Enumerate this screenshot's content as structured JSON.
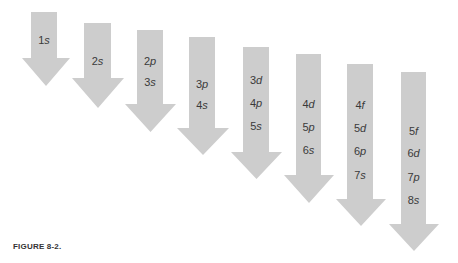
{
  "caption": "FIGURE 8-2.",
  "colors": {
    "arrow": "#cdcdcd",
    "text": "#3a3a3a"
  },
  "arrows": [
    {
      "shaft_left": 31,
      "shaft_right": 57,
      "top": 12,
      "head_start": 58,
      "head_left": 22,
      "head_right": 70,
      "tip": 86,
      "labels": [
        {
          "n": "1",
          "l": "s",
          "y": 40
        }
      ]
    },
    {
      "shaft_left": 84,
      "shaft_right": 111,
      "top": 23,
      "head_start": 78,
      "head_left": 72,
      "head_right": 124,
      "tip": 108,
      "labels": [
        {
          "n": "2",
          "l": "s",
          "y": 61
        }
      ]
    },
    {
      "shaft_left": 137,
      "shaft_right": 163,
      "top": 30,
      "head_start": 104,
      "head_left": 125,
      "head_right": 176,
      "tip": 132,
      "labels": [
        {
          "n": "2",
          "l": "p",
          "y": 61
        },
        {
          "n": "3",
          "l": "s",
          "y": 82
        }
      ]
    },
    {
      "shaft_left": 189,
      "shaft_right": 215,
      "top": 37,
      "head_start": 128,
      "head_left": 177,
      "head_right": 229,
      "tip": 155,
      "labels": [
        {
          "n": "3",
          "l": "p",
          "y": 84
        },
        {
          "n": "4",
          "l": "s",
          "y": 105
        }
      ]
    },
    {
      "shaft_left": 243,
      "shaft_right": 269,
      "top": 47,
      "head_start": 152,
      "head_left": 231,
      "head_right": 282,
      "tip": 179,
      "labels": [
        {
          "n": "3",
          "l": "d",
          "y": 80
        },
        {
          "n": "4",
          "l": "p",
          "y": 103
        },
        {
          "n": "5",
          "l": "s",
          "y": 126
        }
      ]
    },
    {
      "shaft_left": 296,
      "shaft_right": 321,
      "top": 54,
      "head_start": 175,
      "head_left": 284,
      "head_right": 334,
      "tip": 203,
      "labels": [
        {
          "n": "4",
          "l": "d",
          "y": 104
        },
        {
          "n": "5",
          "l": "p",
          "y": 127
        },
        {
          "n": "6",
          "l": "s",
          "y": 150
        }
      ]
    },
    {
      "shaft_left": 347,
      "shaft_right": 373,
      "top": 64,
      "head_start": 199,
      "head_left": 336,
      "head_right": 386,
      "tip": 226,
      "labels": [
        {
          "n": "4",
          "l": "f",
          "y": 105
        },
        {
          "n": "5",
          "l": "d",
          "y": 128
        },
        {
          "n": "6",
          "l": "p",
          "y": 151
        },
        {
          "n": "7",
          "l": "s",
          "y": 175
        }
      ]
    },
    {
      "shaft_left": 401,
      "shaft_right": 426,
      "top": 72,
      "head_start": 224,
      "head_left": 389,
      "head_right": 439,
      "tip": 251,
      "labels": [
        {
          "n": "5",
          "l": "f",
          "y": 131
        },
        {
          "n": "6",
          "l": "d",
          "y": 153
        },
        {
          "n": "7",
          "l": "p",
          "y": 177
        },
        {
          "n": "8",
          "l": "s",
          "y": 200
        }
      ]
    }
  ]
}
